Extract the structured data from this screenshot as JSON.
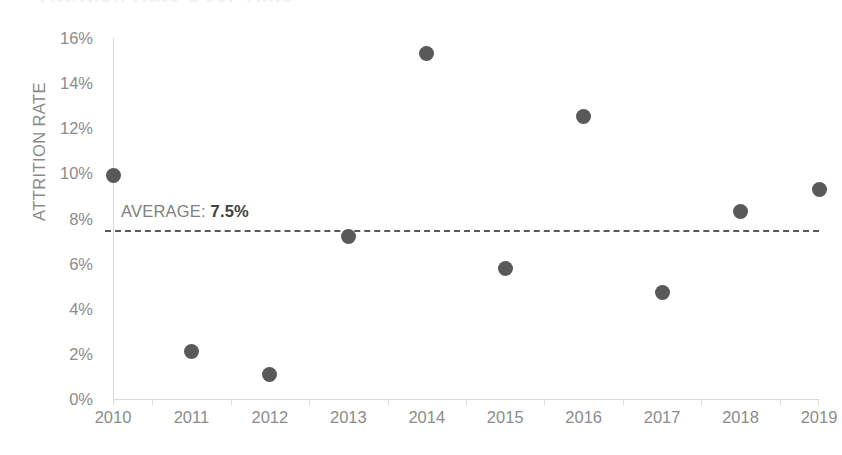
{
  "chart_data": {
    "type": "scatter",
    "title": "Attrition Rate Over Time",
    "title_visible": false,
    "xlabel": "",
    "ylabel": "ATTRITION RATE",
    "categories": [
      "2010",
      "2011",
      "2012",
      "2013",
      "2014",
      "2015",
      "2016",
      "2017",
      "2018",
      "2019"
    ],
    "values": [
      9.9,
      2.1,
      1.1,
      7.2,
      15.3,
      5.8,
      12.5,
      4.7,
      8.3,
      9.3
    ],
    "point_labels": [
      "9.9%",
      "2.1%",
      "1.1%",
      "7.2%",
      "15.3%",
      "5.8%",
      "12.5%",
      "4.7%",
      "8.3%",
      "9.3%"
    ],
    "ylim": [
      0,
      16
    ],
    "ytick_step": 2,
    "ytick_labels": [
      "16%",
      "14%",
      "12%",
      "10%",
      "8%",
      "6%",
      "4%",
      "2%",
      "0%"
    ],
    "ytick_values": [
      16,
      14,
      12,
      10,
      8,
      6,
      4,
      2,
      0
    ],
    "grid": false,
    "legend": false,
    "legend_position": "none",
    "series_color": "#595959",
    "axis_color": "#d9d9d9",
    "tick_label_color": "#8c8c8c",
    "reference_line": {
      "label_prefix": "AVERAGE: ",
      "label_value": "7.5%",
      "value": 7.5,
      "style": "dashed",
      "color": "#595959"
    }
  }
}
